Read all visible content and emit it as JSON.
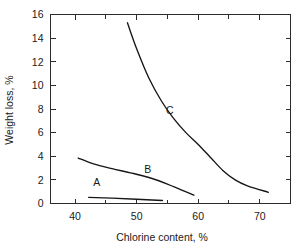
{
  "chart_data": {
    "type": "line",
    "title": "",
    "xlabel": "Chlorine content, %",
    "ylabel": "Weight loss, %",
    "xlim": [
      36,
      75
    ],
    "ylim": [
      0,
      16
    ],
    "xticks": [
      40,
      50,
      60,
      70
    ],
    "xtick_labels": [
      "40",
      "50",
      "60",
      "70"
    ],
    "xminor_ticks": [
      45,
      55,
      65
    ],
    "yticks": [
      0,
      2,
      4,
      6,
      8,
      10,
      12,
      14,
      16
    ],
    "ytick_labels": [
      "0",
      "2",
      "4",
      "6",
      "8",
      "10",
      "12",
      "14",
      "16"
    ],
    "grid": false,
    "legend": "inline-curve-labels",
    "series": [
      {
        "name": "A",
        "label": "A",
        "label_x": 43.5,
        "label_y": 1.45,
        "x": [
          42.2,
          46.0,
          50.0,
          54.2
        ],
        "y": [
          0.52,
          0.45,
          0.36,
          0.25
        ]
      },
      {
        "name": "B",
        "label": "B",
        "label_x": 51.8,
        "label_y": 2.55,
        "x": [
          40.5,
          43.0,
          46.0,
          49.0,
          52.0,
          55.0,
          59.3
        ],
        "y": [
          3.85,
          3.35,
          2.95,
          2.6,
          2.2,
          1.65,
          0.7
        ]
      },
      {
        "name": "C",
        "label": "C",
        "label_x": 55.4,
        "label_y": 7.6,
        "x": [
          48.5,
          50.0,
          52.0,
          54.0,
          56.0,
          58.0,
          60.0,
          62.0,
          64.0,
          66.0,
          68.0,
          71.4
        ],
        "y": [
          15.3,
          13.1,
          10.6,
          8.7,
          7.2,
          6.0,
          5.0,
          3.9,
          2.8,
          2.0,
          1.5,
          0.95
        ]
      }
    ]
  },
  "figure": {
    "background_color": "#ffffff",
    "axis_color": "#2b2b2b",
    "curve_color": "#161616",
    "text_color": "#1a1a1a"
  }
}
